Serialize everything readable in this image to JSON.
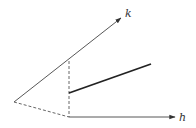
{
  "diagram": {
    "labels": {
      "k_axis": "k",
      "h_axis": "h"
    },
    "colors": {
      "line": "#333333",
      "background": "#ffffff"
    },
    "geometry": {
      "origin": [
        14,
        102
      ],
      "k_axis_tip": [
        122,
        17
      ],
      "h_axis_start": [
        69,
        117
      ],
      "h_axis_tip": [
        176,
        117
      ],
      "vertical_dashed_top": [
        69,
        61
      ],
      "segment_start": [
        69,
        93
      ],
      "segment_end": [
        151,
        64
      ]
    }
  }
}
